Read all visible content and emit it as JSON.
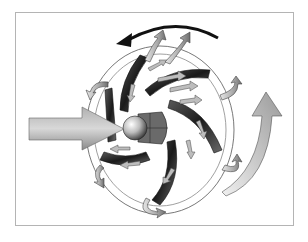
{
  "figure": {
    "colors": {
      "frame_border": "#b4b4b4",
      "background": "#ffffff",
      "vane_dark": "#2a2a2a",
      "arrow_light": "#c8c8c8",
      "arrow_mid": "#8c8c8c",
      "rotation_arrow": "#111111"
    },
    "elements": [
      {
        "name": "inlet-arrow",
        "direction": "right"
      },
      {
        "name": "rotation-arrow",
        "direction": "counterclockwise"
      },
      {
        "name": "outlet-arrow",
        "direction": "up"
      },
      {
        "name": "impeller-hub"
      },
      {
        "name": "impeller-vanes",
        "count": 6
      },
      {
        "name": "flow-arrows"
      }
    ]
  }
}
